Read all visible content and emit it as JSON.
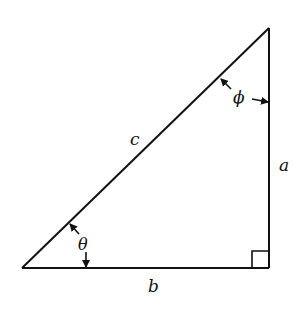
{
  "diagram": {
    "colors": {
      "stroke": "#111111",
      "background": "#ffffff"
    },
    "vertices": {
      "bottom_left": [
        22,
        268
      ],
      "right_angle": [
        269,
        268
      ],
      "top": [
        269,
        28
      ]
    },
    "sides": {
      "hypotenuse": {
        "label": "c"
      },
      "vertical": {
        "label": "a"
      },
      "base": {
        "label": "b"
      }
    },
    "angles": {
      "bottom_left": {
        "label": "θ"
      },
      "top": {
        "label": "ϕ"
      },
      "right_angle": {
        "marker": "square"
      }
    }
  }
}
